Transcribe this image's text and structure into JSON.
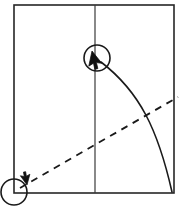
{
  "canvas": {
    "width": 181,
    "height": 213,
    "background_color": "#ffffff",
    "stroke_color": "#1a1a1a",
    "title": "drag-gesture-trajectory-diagram"
  },
  "frame": {
    "name": "bounding-rectangle",
    "x": 14,
    "y": 5,
    "width": 160,
    "height": 188,
    "stroke_width": 1.6,
    "stroke_color": "#262626",
    "fill": "none"
  },
  "center_line": {
    "name": "vertical-center-line",
    "x": 95,
    "y_top": 5,
    "y_bottom": 193,
    "stroke_width": 1.2,
    "stroke_color": "#3a3a3a"
  },
  "curve": {
    "name": "curved-drag-path",
    "start": {
      "x": 101,
      "y": 62
    },
    "control_1": {
      "x": 140,
      "y": 92
    },
    "control_2": {
      "x": 158,
      "y": 130
    },
    "end": {
      "x": 172,
      "y": 192
    },
    "stroke_width": 1.6,
    "stroke_color": "#1a1a1a",
    "dashed": false
  },
  "dashed_line": {
    "name": "dashed-reference-line",
    "start": {
      "x": 20,
      "y": 188
    },
    "end": {
      "x": 178,
      "y": 97
    },
    "stroke_width": 1.8,
    "stroke_color": "#1a1a1a",
    "dash_pattern": "7 6"
  },
  "markers": [
    {
      "name": "upper-cursor-marker",
      "circle": {
        "cx": 97,
        "cy": 58,
        "r": 13
      },
      "cursor": {
        "tip_x": 92,
        "tip_y": 51,
        "rotation": 12,
        "scale": 1.0
      },
      "stroke_width": 1.6,
      "label": "target-endpoint"
    },
    {
      "name": "lower-cursor-marker",
      "circle": {
        "cx": 14,
        "cy": 192,
        "r": 13
      },
      "cursor": {
        "tip_x": 27,
        "tip_y": 185,
        "rotation": 195,
        "scale": 0.72
      },
      "stroke_width": 1.6,
      "label": "origin-endpoint"
    }
  ]
}
